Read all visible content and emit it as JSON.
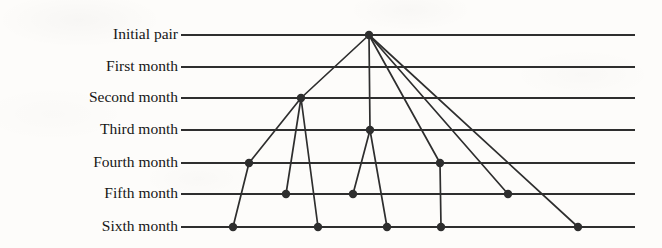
{
  "figure": {
    "type": "tree-diagram",
    "width": 662,
    "height": 248,
    "background_color": "#fdfcfa",
    "ink_color": "#2e2e2e",
    "line_start_x": 181,
    "line_end_x": 635
  },
  "rows": [
    {
      "id": "initial",
      "label": "Initial pair",
      "y": 35,
      "pairs": 1
    },
    {
      "id": "month1",
      "label": "First month",
      "y": 67,
      "pairs": 1
    },
    {
      "id": "month2",
      "label": "Second month",
      "y": 98,
      "pairs": 2
    },
    {
      "id": "month3",
      "label": "Third month",
      "y": 130,
      "pairs": 3
    },
    {
      "id": "month4",
      "label": "Fourth month",
      "y": 163,
      "pairs": 5
    },
    {
      "id": "month5",
      "label": "Fifth month",
      "y": 194,
      "pairs": 8
    },
    {
      "id": "month6",
      "label": "Sixth month",
      "y": 227,
      "pairs": 13
    }
  ],
  "nodes": [
    {
      "id": "n0",
      "row": "initial",
      "x": 369,
      "y": 35
    },
    {
      "id": "n1",
      "row": "month2",
      "x": 301,
      "y": 98
    },
    {
      "id": "n2",
      "row": "month3",
      "x": 370,
      "y": 130
    },
    {
      "id": "n3",
      "row": "month4",
      "x": 249,
      "y": 163
    },
    {
      "id": "n4",
      "row": "month4",
      "x": 440,
      "y": 163
    },
    {
      "id": "n5",
      "row": "month5",
      "x": 286,
      "y": 194
    },
    {
      "id": "n6",
      "row": "month5",
      "x": 353,
      "y": 194
    },
    {
      "id": "n7",
      "row": "month5",
      "x": 508,
      "y": 194
    },
    {
      "id": "n8",
      "row": "month6",
      "x": 233,
      "y": 227
    },
    {
      "id": "n9",
      "row": "month6",
      "x": 318,
      "y": 227
    },
    {
      "id": "n10",
      "row": "month6",
      "x": 387,
      "y": 227
    },
    {
      "id": "n11",
      "row": "month6",
      "x": 441,
      "y": 227
    },
    {
      "id": "n12",
      "row": "month6",
      "x": 578,
      "y": 227
    }
  ],
  "edges": [
    {
      "from": "n0",
      "to": "n1"
    },
    {
      "from": "n0",
      "to": "n2"
    },
    {
      "from": "n0",
      "to": "n4"
    },
    {
      "from": "n0",
      "to": "n7"
    },
    {
      "from": "n0",
      "to": "n12"
    },
    {
      "from": "n1",
      "to": "n3"
    },
    {
      "from": "n1",
      "to": "n5"
    },
    {
      "from": "n1",
      "to": "n9"
    },
    {
      "from": "n2",
      "to": "n6"
    },
    {
      "from": "n2",
      "to": "n10"
    },
    {
      "from": "n3",
      "to": "n8"
    },
    {
      "from": "n4",
      "to": "n11"
    }
  ],
  "style": {
    "node_radius": 4.2,
    "row_line_width": 1.9,
    "edge_line_width": 1.7,
    "label_right_edge": 178,
    "label_font_size": 15.5
  }
}
